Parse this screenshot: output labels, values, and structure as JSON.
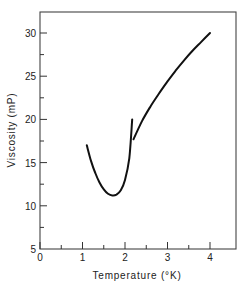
{
  "chart_data": {
    "type": "line",
    "title": "",
    "xlabel": "Temperature (°K)",
    "ylabel": "Viscosity (mP)",
    "xlim": [
      0,
      4.6
    ],
    "ylim": [
      5,
      32.5
    ],
    "grid": false,
    "legend": null,
    "x_ticks": [
      0,
      1,
      2,
      3,
      4
    ],
    "x_tick_labels": [
      "0",
      "1",
      "2",
      "3",
      "4"
    ],
    "x_minor_ticks": [
      0.5,
      1.5,
      2.5,
      3.5
    ],
    "y_ticks": [
      5,
      10,
      15,
      20,
      25,
      30
    ],
    "y_tick_labels": [
      "5",
      "10",
      "15",
      "20",
      "25",
      "30"
    ],
    "y_minor_ticks": [
      7.5,
      12.5,
      17.5,
      22.5,
      27.5
    ],
    "series": [
      {
        "name": "He II (below lambda point)",
        "x": [
          1.1,
          1.2,
          1.3,
          1.4,
          1.5,
          1.6,
          1.7,
          1.8,
          1.9,
          2.0,
          2.1,
          2.17
        ],
        "y": [
          17.0,
          15.2,
          13.8,
          12.7,
          11.9,
          11.4,
          11.2,
          11.3,
          11.8,
          13.0,
          15.5,
          20.0
        ]
      },
      {
        "name": "He I (above lambda point)",
        "x": [
          2.2,
          2.4,
          2.6,
          2.8,
          3.0,
          3.2,
          3.4,
          3.6,
          3.8,
          4.0
        ],
        "y": [
          17.7,
          19.8,
          21.5,
          23.0,
          24.4,
          25.7,
          26.9,
          28.0,
          29.0,
          30.0
        ]
      }
    ]
  },
  "labels": {
    "xlabel": "Temperature (°K)",
    "ylabel": "Viscosity (mP)"
  }
}
